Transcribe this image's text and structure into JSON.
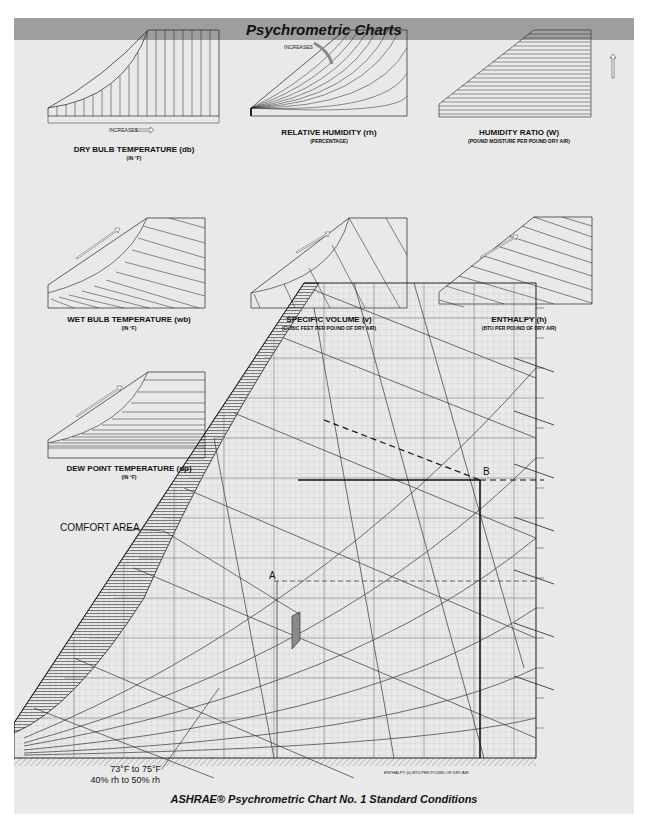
{
  "header": {
    "title": "Psychrometric Charts"
  },
  "mini_charts": [
    {
      "id": "dry-bulb",
      "title": "DRY BULB TEMPERATURE (db)",
      "subtitle": "(IN °F)",
      "arrow_label": "INCREASES",
      "ticks": [
        "25",
        "30",
        "35",
        "40",
        "45",
        "50",
        "55",
        "60",
        "65",
        "70",
        "75",
        "80",
        "85",
        "90",
        "95",
        "100",
        "105",
        "110",
        "115",
        "120"
      ]
    },
    {
      "id": "relative-humidity",
      "title": "RELATIVE HUMIDITY (rh)",
      "subtitle": "(PERCENTAGE)",
      "arrow_label": "INCREASES",
      "ticks": [
        "100%",
        "90%",
        "80%",
        "70%",
        "60%",
        "50%",
        "40%",
        "30%",
        "20%",
        "10%"
      ]
    },
    {
      "id": "humidity-ratio",
      "title": "HUMIDITY RATIO (W)",
      "subtitle": "(POUND MOISTURE PER POUND DRY AIR)",
      "arrow_label": "INCREASES",
      "ticks": [
        ".030",
        ".028",
        ".026",
        ".024",
        ".022",
        ".020",
        ".018",
        ".016",
        ".014",
        ".012",
        ".010",
        ".008",
        ".006",
        ".004",
        ".002"
      ]
    },
    {
      "id": "wet-bulb",
      "title": "WET BULB TEMPERATURE (wb)",
      "subtitle": "(IN °F)",
      "arrow_label": "INCREASES",
      "ticks": [
        "35",
        "40",
        "45",
        "50",
        "55",
        "60",
        "65",
        "70",
        "75",
        "80",
        "85"
      ]
    },
    {
      "id": "specific-volume",
      "title": "SPECIFIC VOLUME (v)",
      "subtitle": "(CUBIC FEET PER POUND OF DRY AIR)",
      "arrow_label": "INCREASES",
      "ticks": [
        "12.5",
        "13.0",
        "13.5",
        "14.0",
        "14.5",
        "15.0"
      ]
    },
    {
      "id": "enthalpy",
      "title": "ENTHALPY (h)",
      "subtitle": "(BTU PER POUND OF DRY AIR)",
      "arrow_label": "INCREASES",
      "ticks": [
        "15",
        "20",
        "25",
        "30",
        "35",
        "40",
        "45",
        "50",
        "55",
        "60"
      ]
    },
    {
      "id": "dew-point",
      "title": "DEW POINT TEMPERATURE (dp)",
      "subtitle": "(IN °F)",
      "arrow_label": "INCREASES",
      "ticks": [
        "35",
        "40",
        "45",
        "50",
        "55",
        "60",
        "65",
        "70",
        "75",
        "80"
      ]
    }
  ],
  "main_chart": {
    "point_a": "A",
    "point_b": "B",
    "comfort_label": "COMFORT AREA",
    "comfort_note_line1": "73°F to 75°F",
    "comfort_note_line2": "40% rh to 50% rh",
    "x_ticks": [
      "35",
      "40",
      "45",
      "50",
      "55",
      "60",
      "65",
      "70",
      "75",
      "80",
      "85",
      "90",
      "95",
      "100",
      "105",
      "110",
      "115",
      "120"
    ],
    "right_ticks": [
      ".028",
      ".026",
      ".024",
      ".022",
      ".020",
      ".018",
      ".016",
      ".014",
      ".012",
      ".010",
      ".008",
      ".006",
      ".004",
      ".002"
    ],
    "enthalpy_right_ticks": [
      "60",
      "55",
      "50",
      "45",
      "40",
      "35",
      "30"
    ],
    "enthalpy_bottom_ticks": [
      "10",
      "15",
      "20",
      "25"
    ],
    "enthalpy_axis_label": "ENTHALPY (h) BTU PER POUND OF DRY AIR",
    "enthalpy_left_label": "ENTHALPY (h) BTU PER POUND OF DRY AIR",
    "saturation_label": "SATURATION TEMPERATURE °F",
    "rh_label": "10% RELATIVE HUMIDITY",
    "wb_label": "80°F WET BULB TEMPERATURE",
    "db_label": "DRY BULB TEMPERATURE °F",
    "hr_label": "HUMIDITY RATIO (W) - POUNDS MOISTURE PER POUND DRY AIR",
    "volume_label": "14.5 CU FT PER LB DRY AIR"
  },
  "footer": {
    "caption": "ASHRAE® Psychrometric Chart No. 1 Standard Conditions"
  }
}
